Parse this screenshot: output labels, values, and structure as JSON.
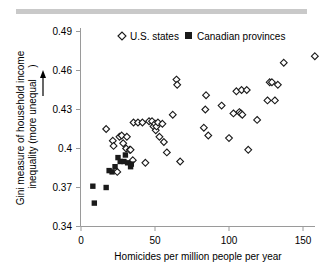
{
  "figure": {
    "top_rule_color": "#c9c9c9",
    "background_color": "#ffffff",
    "axis_color": "#808080",
    "marker_color": "#1a1a1a"
  },
  "legend": {
    "position": "top-center-inside",
    "entries": [
      {
        "label": "U.S. states",
        "marker": "open-diamond"
      },
      {
        "label": "Canadian provinces",
        "marker": "filled-square"
      }
    ]
  },
  "chart_data": {
    "type": "scatter",
    "title": "",
    "xlabel": "Homicides per million people per year",
    "ylabel": "Gini measure of household income inequality (more unequal ↑)",
    "ylabel_line1": "Gini measure of household income",
    "ylabel_line2": "inequality (more unequal",
    "ylabel_arrow": "↑",
    "ylabel_paren_close": ")",
    "xlim": [
      0,
      160
    ],
    "ylim": [
      0.34,
      0.49
    ],
    "xticks": [
      0,
      50,
      100,
      150
    ],
    "xtick_labels": [
      "0",
      "50",
      "100",
      "150"
    ],
    "yticks": [
      0.34,
      0.37,
      0.4,
      0.43,
      0.46,
      0.49
    ],
    "ytick_labels": [
      "0.34",
      "0.37",
      "0.4",
      "0.43",
      "0.46",
      "0.49"
    ],
    "grid": false,
    "legend_position": "top-center",
    "series": [
      {
        "name": "U.S. states",
        "marker": "open-diamond",
        "points": [
          [
            17.0,
            0.415
          ],
          [
            21.5,
            0.406
          ],
          [
            22.0,
            0.402
          ],
          [
            24.5,
            0.382
          ],
          [
            26.0,
            0.409
          ],
          [
            27.5,
            0.41
          ],
          [
            28.5,
            0.404
          ],
          [
            30.5,
            0.4
          ],
          [
            31.0,
            0.409
          ],
          [
            33.0,
            0.399
          ],
          [
            33.5,
            0.399
          ],
          [
            35.0,
            0.391
          ],
          [
            35.5,
            0.42
          ],
          [
            38.5,
            0.42
          ],
          [
            41.5,
            0.42
          ],
          [
            43.5,
            0.389
          ],
          [
            46.0,
            0.421
          ],
          [
            48.0,
            0.421
          ],
          [
            49.0,
            0.417
          ],
          [
            50.0,
            0.419
          ],
          [
            50.5,
            0.414
          ],
          [
            51.0,
            0.417
          ],
          [
            52.0,
            0.42
          ],
          [
            53.0,
            0.409
          ],
          [
            55.0,
            0.419
          ],
          [
            56.0,
            0.405
          ],
          [
            58.0,
            0.397
          ],
          [
            62.0,
            0.426
          ],
          [
            64.5,
            0.453
          ],
          [
            65.0,
            0.449
          ],
          [
            67.0,
            0.39
          ],
          [
            83.0,
            0.416
          ],
          [
            84.0,
            0.43
          ],
          [
            84.5,
            0.441
          ],
          [
            86.0,
            0.41
          ],
          [
            95.0,
            0.433
          ],
          [
            100.0,
            0.408
          ],
          [
            103.0,
            0.427
          ],
          [
            105.0,
            0.444
          ],
          [
            107.0,
            0.428
          ],
          [
            108.0,
            0.427
          ],
          [
            108.5,
            0.445
          ],
          [
            109.0,
            0.426
          ],
          [
            112.0,
            0.445
          ],
          [
            113.0,
            0.399
          ],
          [
            119.0,
            0.422
          ],
          [
            126.0,
            0.437
          ],
          [
            127.5,
            0.451
          ],
          [
            129.0,
            0.451
          ],
          [
            131.0,
            0.437
          ],
          [
            133.0,
            0.449
          ],
          [
            137.0,
            0.466
          ],
          [
            158.0,
            0.471
          ]
        ]
      },
      {
        "name": "Canadian provinces",
        "marker": "filled-square",
        "points": [
          [
            8.0,
            0.371
          ],
          [
            9.0,
            0.358
          ],
          [
            17.0,
            0.37
          ],
          [
            19.0,
            0.383
          ],
          [
            21.0,
            0.382
          ],
          [
            23.0,
            0.386
          ],
          [
            25.0,
            0.393
          ],
          [
            26.5,
            0.39
          ],
          [
            29.0,
            0.39
          ],
          [
            30.0,
            0.395
          ],
          [
            31.5,
            0.389
          ],
          [
            33.5,
            0.386
          ],
          [
            34.0,
            0.388
          ]
        ]
      }
    ]
  }
}
